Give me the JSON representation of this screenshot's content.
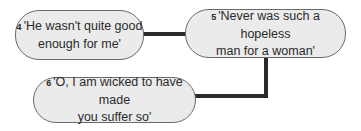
{
  "diagram": {
    "nodes": [
      {
        "id": "4",
        "number": "4",
        "line1": "'He wasn't quite good",
        "line2": "enough for me'"
      },
      {
        "id": "5",
        "number": "5",
        "line1": "'Never was such a hopeless",
        "line2": "man for a woman'"
      },
      {
        "id": "6",
        "number": "6",
        "line1": "'O, I am wicked to have made",
        "line2": "you suffer so'"
      }
    ],
    "edges": [
      {
        "from": "4",
        "to": "5"
      },
      {
        "from": "5",
        "to": "6"
      }
    ],
    "colors": {
      "node_fill": "#ebebeb",
      "node_border": "#6a6a6a",
      "connector": "#2a2a2a",
      "text": "#2a2a2a"
    }
  }
}
